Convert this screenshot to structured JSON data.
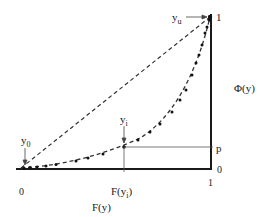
{
  "diagram": {
    "labels": {
      "y_u": "y",
      "y_u_sub": "u",
      "y_0": "y",
      "y_0_sub": "0",
      "y_i": "y",
      "y_i_sub": "i",
      "right_axis_top": "1",
      "right_axis_bottom": "0",
      "right_axis_title": "Φ(y)",
      "p_level": "p",
      "bottom_axis_left": "0",
      "bottom_axis_right": "1",
      "bottom_axis_tick": "F(y",
      "bottom_axis_tick_sub": "i",
      "bottom_axis_tick_close": ")",
      "bottom_axis_title": "F(y)"
    },
    "curves": [
      {
        "name": "straight diagonal",
        "style": "dashed",
        "from": [
          0,
          0
        ],
        "to": [
          1,
          1
        ]
      },
      {
        "name": "convex sample curve",
        "style": "dashed with dots",
        "from": [
          0,
          0
        ],
        "to": [
          1,
          1
        ]
      }
    ],
    "colors": {
      "line": "#1a1a1a",
      "guide": "#555555",
      "background": "#ffffff"
    }
  }
}
